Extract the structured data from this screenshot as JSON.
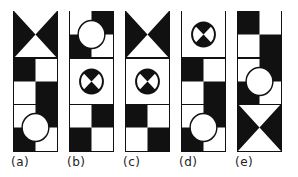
{
  "figure": {
    "colors": {
      "fill": "#111111",
      "background": "#ffffff"
    },
    "panels": [
      {
        "label": "(a)",
        "x": 13,
        "blocks": [
          "hourglass",
          "checker-bl",
          "checker-wb-circle"
        ]
      },
      {
        "label": "(b)",
        "x": 69,
        "blocks": [
          "checker-wb-circle",
          "crossed-circle",
          "checker-wb"
        ]
      },
      {
        "label": "(c)",
        "x": 125,
        "blocks": [
          "hourglass",
          "crossed-circle",
          "checker-bl"
        ]
      },
      {
        "label": "(d)",
        "x": 181,
        "blocks": [
          "crossed-circle",
          "checker-bl",
          "checker-wb-circle"
        ]
      },
      {
        "label": "(e)",
        "x": 237,
        "blocks": [
          "checker-bl",
          "checker-wb-circle",
          "hourglass"
        ]
      }
    ]
  }
}
